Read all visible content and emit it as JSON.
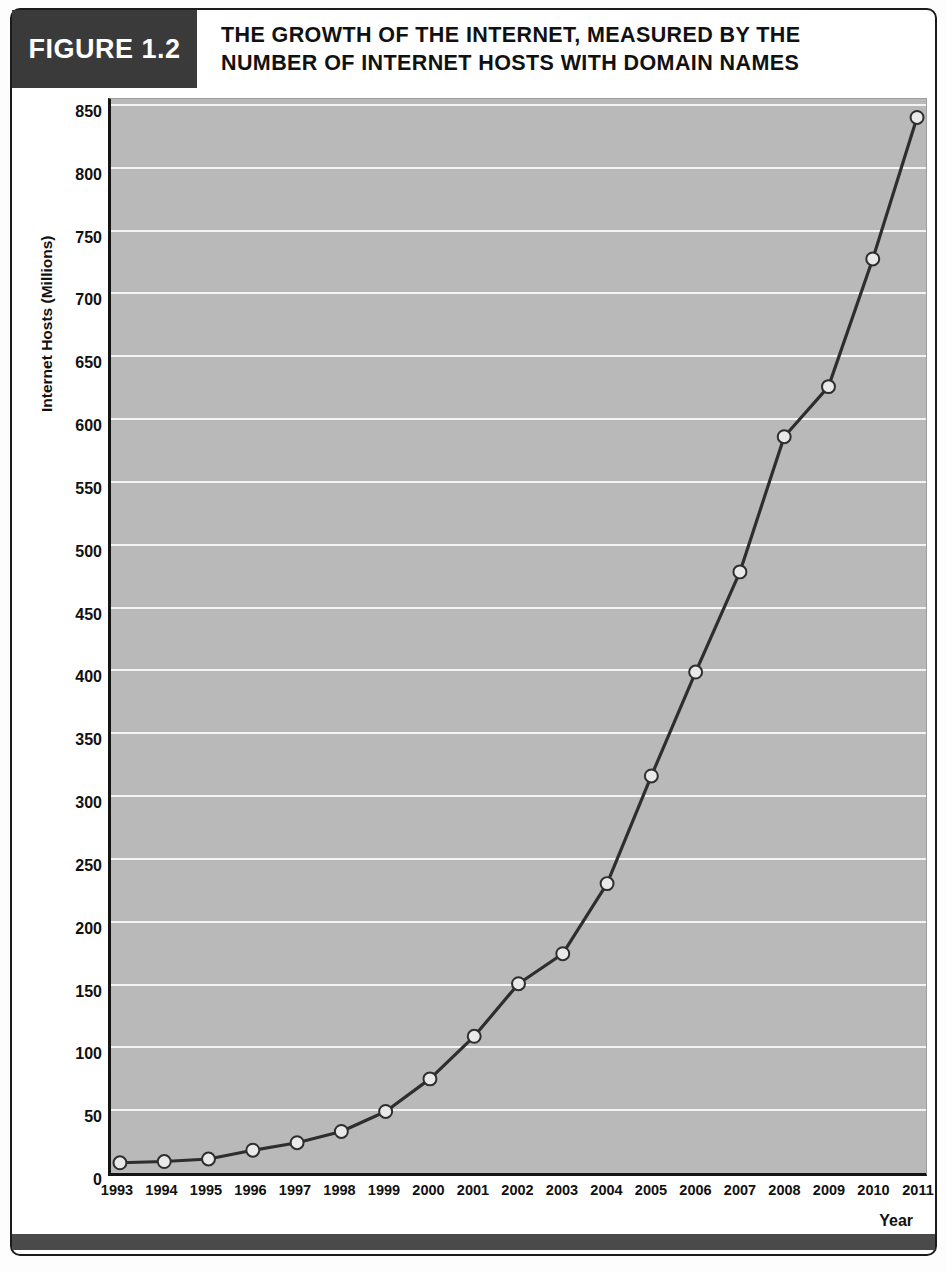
{
  "figure": {
    "tag": "FIGURE 1.2",
    "title_line1": "THE GROWTH OF THE INTERNET, MEASURED BY THE",
    "title_line2": "NUMBER OF INTERNET HOSTS WITH DOMAIN NAMES",
    "tag_background": "#3a3a3a",
    "plot_background": "#b9b9b9",
    "line_color": "#2e2e2e",
    "marker_fill": "#e9e9e9",
    "gridline_color": "#f4f4f4"
  },
  "chart_data": {
    "type": "line",
    "title": "THE GROWTH OF THE INTERNET, MEASURED BY THE NUMBER OF INTERNET HOSTS WITH DOMAIN NAMES",
    "xlabel": "Year",
    "ylabel": "Internet Hosts (Millions)",
    "x": [
      1993,
      1994,
      1995,
      1996,
      1997,
      1998,
      1999,
      2000,
      2001,
      2002,
      2003,
      2004,
      2005,
      2006,
      2007,
      2008,
      2009,
      2010,
      2011
    ],
    "categories": [
      "1993",
      "1994",
      "1995",
      "1996",
      "1997",
      "1998",
      "1999",
      "2000",
      "2001",
      "2002",
      "2003",
      "2004",
      "2005",
      "2006",
      "2007",
      "2008",
      "2009",
      "2010",
      "2011"
    ],
    "values": [
      5,
      6,
      8,
      15,
      21,
      30,
      46,
      72,
      106,
      148,
      172,
      228,
      314,
      397,
      477,
      585,
      625,
      727,
      840
    ],
    "series": [
      {
        "name": "Internet Hosts (Millions)",
        "values": [
          5,
          6,
          8,
          15,
          21,
          30,
          46,
          72,
          106,
          148,
          172,
          228,
          314,
          397,
          477,
          585,
          625,
          727,
          840
        ]
      }
    ],
    "ylim": [
      0,
      850
    ],
    "xlim": [
      1993,
      2011
    ],
    "yticks": [
      0,
      50,
      100,
      150,
      200,
      250,
      300,
      350,
      400,
      450,
      500,
      550,
      600,
      650,
      700,
      750,
      800,
      850
    ],
    "ytick_labels": [
      "0",
      "50",
      "100",
      "150",
      "200",
      "250",
      "300",
      "350",
      "400",
      "450",
      "500",
      "550",
      "600",
      "650",
      "700",
      "750",
      "800",
      "850"
    ],
    "grid": true,
    "legend": false,
    "markers": "circle"
  }
}
